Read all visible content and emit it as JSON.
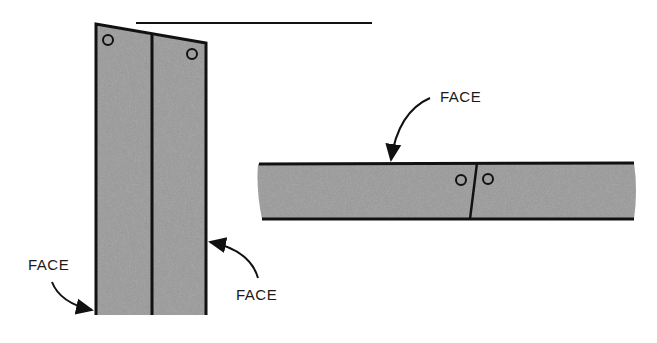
{
  "diagram": {
    "labels": {
      "face_left": "FACE",
      "face_right": "FACE",
      "face_top": "FACE"
    },
    "colors": {
      "board_fill": "#9a9a9a",
      "line": "#111111",
      "background": "#ffffff"
    }
  }
}
